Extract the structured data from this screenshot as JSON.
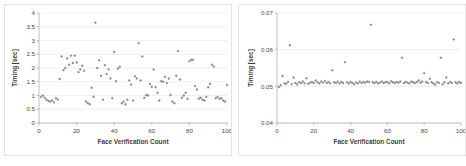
{
  "figure": {
    "panel_count": 2,
    "background_color": "#ffffff",
    "border_color": "#e2e2e2",
    "marker_color": "#8c8c8c"
  },
  "chart_data": [
    {
      "type": "scatter",
      "title": "",
      "xlabel": "Face Verification Count",
      "ylabel": "Timing [sec]",
      "xlim": [
        0,
        100
      ],
      "ylim": [
        0,
        4
      ],
      "xticks": [
        0,
        20,
        40,
        60,
        80,
        100
      ],
      "xtick_labels": [
        "0",
        "20",
        "40",
        "60",
        "80",
        "100"
      ],
      "yticks": [
        0,
        0.5,
        1,
        1.5,
        2,
        2.5,
        3,
        3.5,
        4
      ],
      "ytick_labels": [
        "0",
        "0.5",
        "1",
        "1.5",
        "2",
        "2.5",
        "3",
        "3.5",
        "4"
      ],
      "grid": true,
      "grid_axis": "y",
      "legend": false,
      "series": [
        {
          "name": "Timing",
          "x": [
            1,
            2,
            3,
            4,
            5,
            6,
            7,
            8,
            9,
            10,
            11,
            12,
            13,
            14,
            15,
            16,
            17,
            18,
            19,
            20,
            21,
            22,
            23,
            24,
            25,
            26,
            27,
            28,
            29,
            30,
            31,
            32,
            33,
            34,
            35,
            36,
            37,
            38,
            39,
            40,
            41,
            42,
            43,
            44,
            45,
            46,
            47,
            48,
            49,
            50,
            51,
            52,
            53,
            54,
            55,
            56,
            57,
            58,
            59,
            60,
            61,
            62,
            63,
            64,
            65,
            66,
            67,
            68,
            69,
            70,
            71,
            72,
            73,
            74,
            75,
            76,
            77,
            78,
            79,
            80,
            81,
            82,
            83,
            84,
            85,
            86,
            87,
            88,
            89,
            90,
            91,
            92,
            93,
            94,
            95,
            96,
            97,
            98,
            99,
            100
          ],
          "values": [
            0.95,
            1.0,
            0.92,
            0.85,
            0.8,
            0.78,
            0.82,
            0.75,
            0.9,
            0.85,
            1.6,
            2.42,
            1.92,
            2.0,
            2.35,
            2.12,
            2.45,
            2.18,
            2.45,
            2.2,
            1.85,
            1.95,
            2.08,
            1.9,
            0.78,
            0.72,
            0.68,
            1.28,
            0.95,
            3.65,
            2.0,
            2.28,
            1.72,
            0.85,
            2.1,
            1.78,
            1.95,
            1.62,
            0.9,
            2.58,
            1.52,
            1.98,
            2.05,
            0.72,
            0.78,
            0.68,
            0.85,
            1.55,
            1.4,
            0.82,
            1.7,
            1.62,
            2.9,
            1.55,
            2.42,
            0.92,
            1.02,
            1.0,
            1.42,
            1.32,
            1.95,
            1.3,
            1.1,
            0.82,
            1.52,
            1.5,
            1.68,
            1.45,
            1.62,
            1.02,
            0.78,
            0.72,
            1.72,
            2.62,
            1.58,
            0.92,
            1.0,
            1.1,
            0.88,
            2.25,
            2.3,
            2.3,
            1.35,
            1.22,
            0.88,
            0.92,
            0.85,
            0.82,
            0.95,
            1.3,
            1.42,
            2.12,
            2.05,
            0.9,
            0.95,
            0.88,
            0.9,
            0.82,
            0.78,
            1.38
          ]
        }
      ]
    },
    {
      "type": "scatter",
      "title": "",
      "xlabel": "Face Verification Count",
      "ylabel": "Timing [sec]",
      "xlim": [
        0,
        100
      ],
      "ylim": [
        0.04,
        0.07
      ],
      "xticks": [
        0,
        20,
        40,
        60,
        80,
        100
      ],
      "xtick_labels": [
        "0",
        "20",
        "40",
        "60",
        "80",
        "100"
      ],
      "yticks": [
        0.04,
        0.05,
        0.06,
        0.07
      ],
      "ytick_labels": [
        "0.04",
        "0.05",
        "0.06",
        "0.07"
      ],
      "grid": true,
      "grid_axis": "y",
      "legend": false,
      "series": [
        {
          "name": "Timing",
          "x": [
            1,
            2,
            3,
            4,
            5,
            6,
            7,
            8,
            9,
            10,
            11,
            12,
            13,
            14,
            15,
            16,
            17,
            18,
            19,
            20,
            21,
            22,
            23,
            24,
            25,
            26,
            27,
            28,
            29,
            30,
            31,
            32,
            33,
            34,
            35,
            36,
            37,
            38,
            39,
            40,
            41,
            42,
            43,
            44,
            45,
            46,
            47,
            48,
            49,
            50,
            51,
            52,
            53,
            54,
            55,
            56,
            57,
            58,
            59,
            60,
            61,
            62,
            63,
            64,
            65,
            66,
            67,
            68,
            69,
            70,
            71,
            72,
            73,
            74,
            75,
            76,
            77,
            78,
            79,
            80,
            81,
            82,
            83,
            84,
            85,
            86,
            87,
            88,
            89,
            90,
            91,
            92,
            93,
            94,
            95,
            96,
            97,
            98,
            99,
            100
          ],
          "values": [
            0.0498,
            0.0503,
            0.0528,
            0.0508,
            0.0507,
            0.0512,
            0.0612,
            0.0506,
            0.0524,
            0.0509,
            0.0505,
            0.0511,
            0.0509,
            0.0513,
            0.0508,
            0.0522,
            0.0507,
            0.051,
            0.0512,
            0.0509,
            0.0516,
            0.0511,
            0.0508,
            0.0513,
            0.051,
            0.0515,
            0.0509,
            0.0512,
            0.0508,
            0.0544,
            0.0511,
            0.0509,
            0.0513,
            0.0508,
            0.0512,
            0.0509,
            0.0566,
            0.0511,
            0.0508,
            0.0512,
            0.0509,
            0.0506,
            0.0511,
            0.0508,
            0.0513,
            0.0509,
            0.0512,
            0.051,
            0.0513,
            0.0512,
            0.0668,
            0.0511,
            0.0509,
            0.0512,
            0.0508,
            0.051,
            0.0513,
            0.0509,
            0.0511,
            0.0512,
            0.0508,
            0.0514,
            0.0511,
            0.0509,
            0.0512,
            0.051,
            0.0513,
            0.0578,
            0.0509,
            0.0512,
            0.051,
            0.0508,
            0.0513,
            0.0511,
            0.0509,
            0.0512,
            0.0516,
            0.051,
            0.0513,
            0.0536,
            0.0512,
            0.0509,
            0.0521,
            0.0511,
            0.0508,
            0.0505,
            0.0512,
            0.0509,
            0.0578,
            0.0506,
            0.0511,
            0.0524,
            0.0508,
            0.0512,
            0.0509,
            0.0628,
            0.0511,
            0.0508,
            0.0512,
            0.0509
          ]
        }
      ]
    }
  ]
}
